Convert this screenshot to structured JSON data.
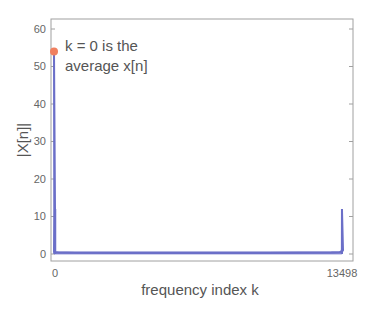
{
  "chart_data": {
    "type": "line",
    "title": "",
    "xlabel": "frequency index k",
    "ylabel": "|X[n]|",
    "xlim": [
      0,
      13498
    ],
    "ylim": [
      0,
      60
    ],
    "x_ticks": [
      0,
      13498
    ],
    "x_tick_labels": [
      "0",
      "13498"
    ],
    "y_ticks": [
      0,
      10,
      20,
      30,
      40,
      50,
      60
    ],
    "y_tick_labels": [
      "0",
      "10",
      "20",
      "30",
      "40",
      "50",
      "60"
    ],
    "grid": false,
    "legend": null,
    "series": [
      {
        "name": "|X[k]|",
        "color": "#6b6fc8",
        "x": [
          0,
          1,
          2,
          5,
          50,
          200,
          1000,
          3000,
          6749,
          10000,
          13000,
          13400,
          13480,
          13493,
          13496,
          13497,
          13498
        ],
        "values": [
          54,
          12,
          1.2,
          0.6,
          0.5,
          0.4,
          0.3,
          0.3,
          0.3,
          0.3,
          0.4,
          0.5,
          0.8,
          1.2,
          12,
          1.0,
          0.6
        ]
      }
    ],
    "highlight_point": {
      "x": 0,
      "y": 54,
      "color": "#f08060"
    },
    "annotations": [
      {
        "text": "k = 0 is the",
        "x": 0,
        "y": 54
      },
      {
        "text": "average x[n]",
        "x": 0,
        "y": 54
      }
    ]
  },
  "annotation": {
    "line1": "k = 0 is the",
    "line2": "average x[n]"
  },
  "axes": {
    "xlabel": "frequency index k",
    "ylabel": "|X[n]|",
    "x_tick_0": "0",
    "x_tick_end": "13498",
    "y_ticks": [
      "0",
      "10",
      "20",
      "30",
      "40",
      "50",
      "60"
    ]
  },
  "colors": {
    "series": "#6b6fc8",
    "highlight": "#f08060",
    "frame": "#999999"
  }
}
